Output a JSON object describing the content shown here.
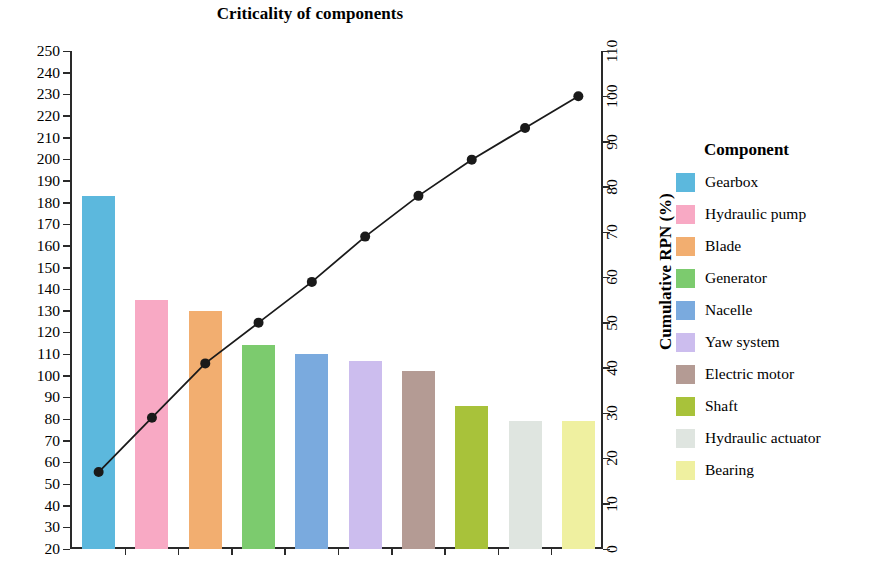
{
  "chart_data": {
    "type": "bar",
    "title": "Criticality of components",
    "subtitle": "",
    "xlabel": "",
    "ylabel": "RPN - mean value",
    "y2label": "Cumulative RPN (%)",
    "ylim": [
      20,
      250
    ],
    "y2lim": [
      0,
      110
    ],
    "ytick_step": 10,
    "y2tick_step": 10,
    "yticks": [
      250,
      240,
      230,
      220,
      210,
      200,
      190,
      180,
      170,
      160,
      150,
      140,
      130,
      120,
      110,
      100,
      90,
      80,
      70,
      60,
      50,
      40,
      30,
      20
    ],
    "y2ticks": [
      110,
      100,
      90,
      80,
      70,
      60,
      50,
      40,
      30,
      20,
      10,
      0
    ],
    "grid": false,
    "xtick_labels_visible": false,
    "legend_position": "right",
    "legend_title": "Component",
    "categories": [
      "Gearbox",
      "Hydraulic pump",
      "Blade",
      "Generator",
      "Nacelle",
      "Yaw system",
      "Electric motor",
      "Shaft",
      "Hydraulic actuator",
      "Bearing"
    ],
    "series": [
      {
        "name": "RPN - mean value",
        "type": "bar",
        "axis": "left",
        "values": [
          183,
          135,
          130,
          114,
          110,
          107,
          102,
          86,
          79,
          79
        ]
      },
      {
        "name": "Cumulative RPN (%)",
        "type": "line",
        "axis": "right",
        "marker": "circle",
        "color": "#1a1a1a",
        "values": [
          17,
          29,
          41,
          50,
          59,
          69,
          78,
          86,
          93,
          100
        ]
      }
    ],
    "bar_colors": [
      "#5cb8dd",
      "#f8a9c4",
      "#f2ae70",
      "#7ccb6e",
      "#7aaade",
      "#ccbdee",
      "#b49b94",
      "#a8c23a",
      "#dfe5e0",
      "#eff0a0"
    ]
  },
  "legend": {
    "title": "Component",
    "items": [
      {
        "label": "Gearbox",
        "color": "#5cb8dd"
      },
      {
        "label": "Hydraulic pump",
        "color": "#f8a9c4"
      },
      {
        "label": "Blade",
        "color": "#f2ae70"
      },
      {
        "label": "Generator",
        "color": "#7ccb6e"
      },
      {
        "label": "Nacelle",
        "color": "#7aaade"
      },
      {
        "label": "Yaw system",
        "color": "#ccbdee"
      },
      {
        "label": "Electric motor",
        "color": "#b49b94"
      },
      {
        "label": "Shaft",
        "color": "#a8c23a"
      },
      {
        "label": "Hydraulic actuator",
        "color": "#dfe5e0"
      },
      {
        "label": "Bearing",
        "color": "#eff0a0"
      }
    ]
  }
}
